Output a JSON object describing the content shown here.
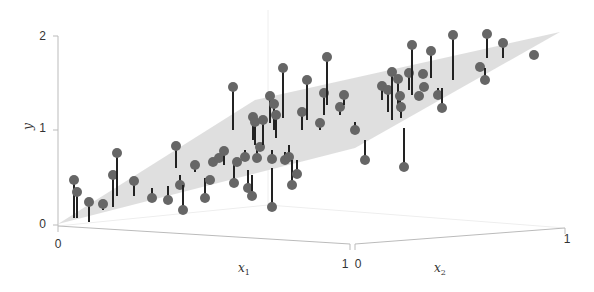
{
  "chart_data": {
    "type": "scatter",
    "subtype": "3d-scatter-with-regression-plane",
    "title": "",
    "xlabel": "x1",
    "x2label": "x2",
    "ylabel": "y",
    "xlim": [
      0,
      1
    ],
    "x2lim": [
      0,
      1
    ],
    "ylim": [
      0,
      2
    ],
    "ticks": {
      "y": [
        "0",
        "1",
        "2"
      ],
      "x1": [
        "0",
        "1"
      ],
      "x2": [
        "0",
        "1"
      ]
    },
    "grid": false,
    "legend": null,
    "colors": {
      "point_front": "#666666",
      "point_behind": "#c8c8c8",
      "residual_front": "#222222",
      "residual_behind": "#bbbbbb",
      "plane": "#dcdcdc",
      "axis": "#bbbbbb"
    },
    "plane_screen_polygon": [
      [
        58,
        224
      ],
      [
        255,
        100
      ],
      [
        560,
        32
      ],
      [
        355,
        148
      ]
    ],
    "points_screen": [
      {
        "x": 74,
        "y": 180,
        "y0": 218,
        "above": true
      },
      {
        "x": 77,
        "y": 192,
        "y0": 218,
        "above": true
      },
      {
        "x": 89,
        "y": 202,
        "y0": 222,
        "above": false
      },
      {
        "x": 103,
        "y": 204,
        "y0": 210,
        "above": true
      },
      {
        "x": 113,
        "y": 175,
        "y0": 207,
        "above": true
      },
      {
        "x": 117,
        "y": 153,
        "y0": 196,
        "above": true
      },
      {
        "x": 134,
        "y": 181,
        "y0": 196,
        "above": true
      },
      {
        "x": 152,
        "y": 198,
        "y0": 188,
        "above": false
      },
      {
        "x": 168,
        "y": 200,
        "y0": 186,
        "above": false
      },
      {
        "x": 176,
        "y": 146,
        "y0": 168,
        "above": true
      },
      {
        "x": 180,
        "y": 185,
        "y0": 175,
        "above": false
      },
      {
        "x": 183,
        "y": 210,
        "y0": 185,
        "above": false
      },
      {
        "x": 195,
        "y": 165,
        "y0": 172,
        "above": true
      },
      {
        "x": 205,
        "y": 198,
        "y0": 178,
        "above": false
      },
      {
        "x": 210,
        "y": 180,
        "y0": 176,
        "above": false
      },
      {
        "x": 213,
        "y": 162,
        "y0": 165,
        "above": true
      },
      {
        "x": 219,
        "y": 158,
        "y0": 160,
        "above": true
      },
      {
        "x": 224,
        "y": 151,
        "y0": 165,
        "above": true
      },
      {
        "x": 233,
        "y": 87,
        "y0": 130,
        "above": true
      },
      {
        "x": 234,
        "y": 183,
        "y0": 162,
        "above": false
      },
      {
        "x": 237,
        "y": 162,
        "y0": 160,
        "above": true
      },
      {
        "x": 245,
        "y": 157,
        "y0": 150,
        "above": true
      },
      {
        "x": 248,
        "y": 188,
        "y0": 170,
        "above": false
      },
      {
        "x": 252,
        "y": 196,
        "y0": 175,
        "above": false
      },
      {
        "x": 253,
        "y": 117,
        "y0": 140,
        "above": true
      },
      {
        "x": 255,
        "y": 122,
        "y0": 145,
        "above": true
      },
      {
        "x": 257,
        "y": 158,
        "y0": 150,
        "above": true
      },
      {
        "x": 260,
        "y": 147,
        "y0": 148,
        "above": true
      },
      {
        "x": 263,
        "y": 120,
        "y0": 145,
        "above": true
      },
      {
        "x": 270,
        "y": 96,
        "y0": 123,
        "above": true
      },
      {
        "x": 272,
        "y": 207,
        "y0": 168,
        "above": false
      },
      {
        "x": 272,
        "y": 159,
        "y0": 150,
        "above": true
      },
      {
        "x": 274,
        "y": 104,
        "y0": 130,
        "above": true
      },
      {
        "x": 276,
        "y": 115,
        "y0": 138,
        "above": true
      },
      {
        "x": 283,
        "y": 68,
        "y0": 118,
        "above": true
      },
      {
        "x": 285,
        "y": 160,
        "y0": 152,
        "above": true
      },
      {
        "x": 289,
        "y": 157,
        "y0": 145,
        "above": true
      },
      {
        "x": 292,
        "y": 185,
        "y0": 160,
        "above": false
      },
      {
        "x": 297,
        "y": 174,
        "y0": 160,
        "above": false
      },
      {
        "x": 302,
        "y": 112,
        "y0": 130,
        "above": true
      },
      {
        "x": 307,
        "y": 80,
        "y0": 120,
        "above": true
      },
      {
        "x": 320,
        "y": 123,
        "y0": 130,
        "above": false
      },
      {
        "x": 324,
        "y": 93,
        "y0": 115,
        "above": true
      },
      {
        "x": 327,
        "y": 57,
        "y0": 105,
        "above": true
      },
      {
        "x": 340,
        "y": 107,
        "y0": 115,
        "above": true
      },
      {
        "x": 344,
        "y": 95,
        "y0": 105,
        "above": true
      },
      {
        "x": 355,
        "y": 130,
        "y0": 122,
        "above": false
      },
      {
        "x": 365,
        "y": 160,
        "y0": 140,
        "above": false
      },
      {
        "x": 382,
        "y": 86,
        "y0": 100,
        "above": true
      },
      {
        "x": 388,
        "y": 90,
        "y0": 112,
        "above": true
      },
      {
        "x": 392,
        "y": 72,
        "y0": 120,
        "above": true
      },
      {
        "x": 398,
        "y": 79,
        "y0": 110,
        "above": true
      },
      {
        "x": 400,
        "y": 96,
        "y0": 112,
        "above": true
      },
      {
        "x": 401,
        "y": 107,
        "y0": 118,
        "above": true
      },
      {
        "x": 404,
        "y": 167,
        "y0": 128,
        "above": false
      },
      {
        "x": 409,
        "y": 73,
        "y0": 90,
        "above": true
      },
      {
        "x": 412,
        "y": 45,
        "y0": 95,
        "above": true
      },
      {
        "x": 419,
        "y": 96,
        "y0": 95,
        "above": true
      },
      {
        "x": 423,
        "y": 74,
        "y0": 78,
        "above": true
      },
      {
        "x": 424,
        "y": 87,
        "y0": 88,
        "above": true
      },
      {
        "x": 431,
        "y": 51,
        "y0": 78,
        "above": true
      },
      {
        "x": 438,
        "y": 95,
        "y0": 88,
        "above": false
      },
      {
        "x": 442,
        "y": 108,
        "y0": 88,
        "above": false
      },
      {
        "x": 453,
        "y": 35,
        "y0": 80,
        "above": true
      },
      {
        "x": 480,
        "y": 67,
        "y0": 65,
        "above": true
      },
      {
        "x": 485,
        "y": 80,
        "y0": 68,
        "above": false
      },
      {
        "x": 487,
        "y": 34,
        "y0": 58,
        "above": true
      },
      {
        "x": 503,
        "y": 43,
        "y0": 58,
        "above": true
      },
      {
        "x": 534,
        "y": 55,
        "y0": 58,
        "above": false
      }
    ]
  },
  "axes": {
    "y_tick_labels": [
      {
        "label": "2",
        "x": 46,
        "y": 40
      },
      {
        "label": "1",
        "x": 46,
        "y": 132
      },
      {
        "label": "0",
        "x": 46,
        "y": 228
      }
    ],
    "x1_tick_labels": [
      {
        "label": "0",
        "x": 58,
        "y": 248
      },
      {
        "label": "1",
        "x": 345,
        "y": 268
      }
    ],
    "x2_tick_labels": [
      {
        "label": "0",
        "x": 358,
        "y": 268
      },
      {
        "label": "1",
        "x": 567,
        "y": 243
      }
    ],
    "y_label": "y",
    "x1_label": "x",
    "x1_label_sub": "1",
    "x2_label": "x",
    "x2_label_sub": "2"
  }
}
